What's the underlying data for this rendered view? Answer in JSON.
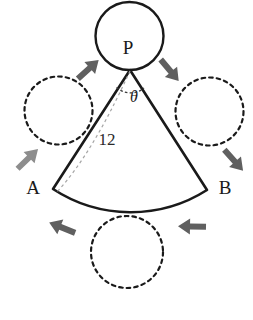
{
  "figure": {
    "background_color": "#ffffff",
    "stroke_color": "#1a1a1a",
    "dashed_color": "#1a1a1a",
    "arrow_color": "#555555",
    "guide_color": "#9a9a9a",
    "labels": {
      "apex": "P",
      "left_corner": "A",
      "right_corner": "B",
      "radius": "12",
      "angle": "θ"
    },
    "shapes": {
      "solid_circle": {
        "name": "top-solid-circle",
        "cx": 129.5,
        "cy": 36,
        "r": 34,
        "style": "solid"
      },
      "dashed_circles": [
        {
          "name": "left-dashed-circle",
          "cx": 58.5,
          "cy": 110.5,
          "r": 34
        },
        {
          "name": "right-dashed-circle",
          "cx": 209.5,
          "cy": 111.5,
          "r": 34
        },
        {
          "name": "bottom-dashed-circle",
          "cx": 127,
          "cy": 252,
          "r": 36
        }
      ],
      "sector": {
        "name": "circular-sector",
        "apex_x": 130,
        "apex_y": 70,
        "a_x": 53,
        "a_y": 189,
        "b_x": 207,
        "b_y": 190,
        "arc_mid_x": 130,
        "arc_mid_y": 215,
        "radius_value": "12"
      },
      "angle_arc": {
        "name": "angle-arc",
        "cx": 130,
        "cy": 70,
        "r": 22
      },
      "dashed_radius": {
        "name": "dashed-radius-line",
        "x1": 130,
        "y1": 70,
        "x2": 58,
        "y2": 193
      }
    },
    "arrows": [
      {
        "name": "arrow-upper-left",
        "x": 88,
        "y": 68,
        "angle": -45
      },
      {
        "name": "arrow-upper-right",
        "x": 170,
        "y": 70,
        "angle": 48
      },
      {
        "name": "arrow-lower-left",
        "x": 28,
        "y": 158,
        "angle": -45
      },
      {
        "name": "arrow-lower-right",
        "x": 233,
        "y": 160,
        "angle": 46
      },
      {
        "name": "arrow-bottom-left",
        "x": 62,
        "y": 228,
        "angle": -160
      },
      {
        "name": "arrow-bottom-right",
        "x": 192,
        "y": 227,
        "angle": 182
      }
    ],
    "label_positions": {
      "apex": {
        "x": 128,
        "y": 50
      },
      "left_corner": {
        "x": 33,
        "y": 190
      },
      "right_corner": {
        "x": 224,
        "y": 190
      },
      "radius": {
        "x": 107,
        "y": 141
      },
      "angle": {
        "x": 134,
        "y": 97
      }
    }
  }
}
